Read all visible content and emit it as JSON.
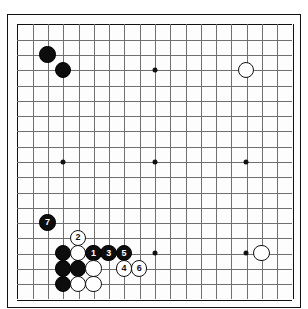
{
  "diagram": {
    "board_size": 19,
    "geometry": {
      "left": 16,
      "top": 23,
      "spacing": 15.28,
      "stone_radius": 8.2,
      "star_radius": 2.5
    },
    "colors": {
      "board_background": "#fdfdfd",
      "grid_line": "#6f6f6f",
      "border": "#111111",
      "black_stone": "#0d0d0d",
      "white_stone": "#ffffff",
      "black_label": "#ffffff",
      "white_label": "#111111"
    },
    "star_points": [
      {
        "col": 3,
        "row": 3
      },
      {
        "col": 9,
        "row": 3
      },
      {
        "col": 15,
        "row": 3
      },
      {
        "col": 3,
        "row": 9
      },
      {
        "col": 9,
        "row": 9
      },
      {
        "col": 15,
        "row": 9
      },
      {
        "col": 3,
        "row": 15
      },
      {
        "col": 9,
        "row": 15
      },
      {
        "col": 15,
        "row": 15
      }
    ],
    "stones": [
      {
        "col": 2,
        "row": 2,
        "color": "black",
        "label": ""
      },
      {
        "col": 3,
        "row": 3,
        "color": "black",
        "label": ""
      },
      {
        "col": 15,
        "row": 3,
        "color": "white",
        "label": ""
      },
      {
        "col": 16,
        "row": 15,
        "color": "white",
        "label": ""
      },
      {
        "col": 2,
        "row": 13,
        "color": "black",
        "label": "7"
      },
      {
        "col": 4,
        "row": 14,
        "color": "white",
        "label": "2"
      },
      {
        "col": 3,
        "row": 15,
        "color": "black",
        "label": ""
      },
      {
        "col": 4,
        "row": 15,
        "color": "white",
        "label": ""
      },
      {
        "col": 5,
        "row": 15,
        "color": "black",
        "label": "1"
      },
      {
        "col": 6,
        "row": 15,
        "color": "black",
        "label": "3"
      },
      {
        "col": 7,
        "row": 15,
        "color": "black",
        "label": "5"
      },
      {
        "col": 3,
        "row": 16,
        "color": "black",
        "label": ""
      },
      {
        "col": 4,
        "row": 16,
        "color": "black",
        "label": ""
      },
      {
        "col": 5,
        "row": 16,
        "color": "white",
        "label": ""
      },
      {
        "col": 7,
        "row": 16,
        "color": "white",
        "label": "4"
      },
      {
        "col": 8,
        "row": 16,
        "color": "white",
        "label": "6"
      },
      {
        "col": 3,
        "row": 17,
        "color": "black",
        "label": ""
      },
      {
        "col": 4,
        "row": 17,
        "color": "white",
        "label": ""
      },
      {
        "col": 5,
        "row": 17,
        "color": "white",
        "label": ""
      }
    ],
    "move_sequence": [
      "1",
      "2",
      "3",
      "4",
      "5",
      "6",
      "7"
    ]
  }
}
